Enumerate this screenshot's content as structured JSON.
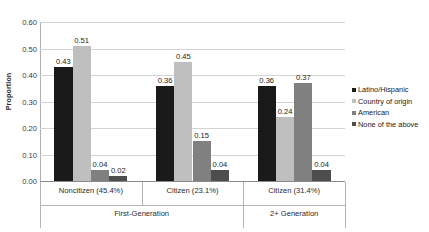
{
  "chart_data": {
    "type": "bar",
    "title": "",
    "xlabel": "",
    "ylabel": "Proportion",
    "ylim": [
      0.0,
      0.6
    ],
    "ytick_step": 0.1,
    "ytick_labels": [
      "0.60",
      "0.50",
      "0.40",
      "0.30",
      "0.20",
      "0.10",
      "0.00"
    ],
    "ytick_values": [
      0.6,
      0.5,
      0.4,
      0.3,
      0.2,
      0.1,
      0.0
    ],
    "grid": true,
    "legend_position": "right",
    "categories": [
      "Noncitizen (45.4%)",
      "Citizen (23.1%)",
      "Citizen (31.4%)"
    ],
    "group_labels": [
      "First-Generation",
      "2+ Generation"
    ],
    "group_spans": [
      2,
      1
    ],
    "series": [
      {
        "name": "Latino/Hispanic",
        "color": "#1a1a1a",
        "values": [
          0.43,
          0.36,
          0.36
        ],
        "value_labels": [
          "0.43",
          "0.36",
          "0.36"
        ]
      },
      {
        "name": "Country of origin",
        "color": "#bfbfbf",
        "values": [
          0.51,
          0.45,
          0.24
        ],
        "value_labels": [
          "0.51",
          "0.45",
          "0.24"
        ]
      },
      {
        "name": "American",
        "color": "#808080",
        "values": [
          0.04,
          0.15,
          0.37
        ],
        "value_labels": [
          "0.04",
          "0.15",
          "0.37"
        ]
      },
      {
        "name": "None of the above",
        "color": "#4d4d4d",
        "values": [
          0.02,
          0.04,
          0.04
        ],
        "value_labels": [
          "0.02",
          "0.04",
          "0.04"
        ]
      }
    ]
  }
}
